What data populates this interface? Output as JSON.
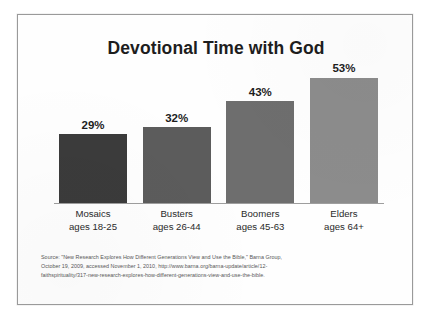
{
  "frame": {
    "border_color": "#9a9a9a",
    "background": "#fefefe"
  },
  "chart_data": {
    "type": "bar",
    "title": "Devotional Time with God",
    "subtitle": "",
    "xlabel": "",
    "ylabel": "",
    "ylim": [
      0,
      60
    ],
    "grid": false,
    "legend": "none",
    "categories": [
      "Mosaics",
      "Busters",
      "Boomers",
      "Elders"
    ],
    "category_sublabels": [
      "ages 18-25",
      "ages 26-44",
      "ages 45-63",
      "ages 64+"
    ],
    "values": [
      29,
      32,
      43,
      53
    ],
    "value_labels": [
      "29%",
      "32%",
      "43%",
      "53%"
    ],
    "bar_colors": [
      "#3b3b3b",
      "#5c5c5c",
      "#6e6e6e",
      "#8c8c8c"
    ],
    "axis_color": "#9e9e9e",
    "value_label_color": "#1d1d1d"
  },
  "source": {
    "line1": "Source: \"New Research Explores How Different Generations View and Use the Bible,\" Barna Group,",
    "line2": "October 19, 2009, accessed November 1, 2010, http://www.barna.org/barna-update/article/12-",
    "line3": "faithspirituality/317-new-research-explores-how-different-generations-view-and-use-the-bible."
  }
}
